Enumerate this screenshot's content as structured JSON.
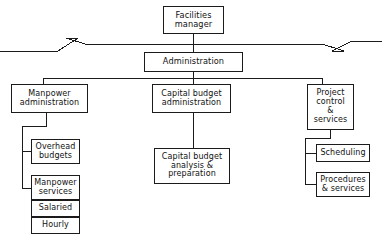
{
  "chart": {
    "type": "org-chart",
    "style": {
      "line_color": "#1b1b1b",
      "box_border_color": "#1b1b1b",
      "box_fill": "#ffffff",
      "text_color": "#111111",
      "background": "#ffffff"
    },
    "nodes": [
      {
        "id": "facilities-manager",
        "label": "Facilities\nmanager",
        "level": 0,
        "x": 163,
        "y": 6,
        "w": 61,
        "h": 28
      },
      {
        "id": "administration",
        "label": "Administration",
        "level": 1,
        "x": 144,
        "y": 52,
        "w": 99,
        "h": 20
      },
      {
        "id": "manpower-administration",
        "label": "Manpower\nadministration",
        "level": 2,
        "x": 11,
        "y": 84,
        "w": 77,
        "h": 29
      },
      {
        "id": "capital-budget-administration",
        "label": "Capital  budget\nadministration",
        "level": 2,
        "x": 152,
        "y": 84,
        "w": 79,
        "h": 29
      },
      {
        "id": "project-control-services",
        "label": "Project\ncontrol\n&\nservices",
        "level": 2,
        "x": 307,
        "y": 84,
        "w": 47,
        "h": 46
      },
      {
        "id": "overhead-budgets",
        "label": "Overhead\nbudgets",
        "level": 3,
        "x": 31,
        "y": 139,
        "w": 49,
        "h": 25
      },
      {
        "id": "manpower-services",
        "label": "Manpower\nservices",
        "level": 3,
        "x": 31,
        "y": 175,
        "w": 49,
        "h": 25
      },
      {
        "id": "salaried",
        "label": "Salaried",
        "level": 4,
        "x": 31,
        "y": 200,
        "w": 49,
        "h": 17
      },
      {
        "id": "hourly",
        "label": "Hourly",
        "level": 4,
        "x": 31,
        "y": 217,
        "w": 49,
        "h": 17
      },
      {
        "id": "capital-budget-analysis",
        "label": "Capital  budget\nanalysis &\npreparation",
        "level": 3,
        "x": 154,
        "y": 148,
        "w": 76,
        "h": 36
      },
      {
        "id": "scheduling",
        "label": "Scheduling",
        "level": 3,
        "x": 316,
        "y": 144,
        "w": 54,
        "h": 18
      },
      {
        "id": "procedures-services",
        "label": "Procedures\n& services",
        "level": 3,
        "x": 316,
        "y": 172,
        "w": 54,
        "h": 25
      }
    ],
    "connectors": {
      "break_line_y": 44,
      "break_symbol_left_x": 72,
      "break_symbol_right_x": 330,
      "distribution_bar_y": 78,
      "distribution_bar_x1": 43,
      "distribution_bar_x2": 322
    }
  }
}
